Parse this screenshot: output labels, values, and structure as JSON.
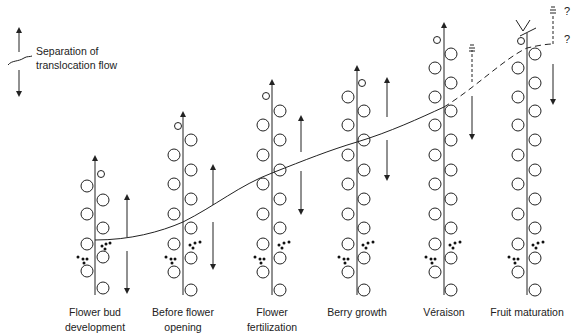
{
  "legend": {
    "line1": "Separation of",
    "line2": "translocation flow"
  },
  "stages": [
    {
      "line1": "Flower bud",
      "line2": "development",
      "x": 95
    },
    {
      "line1": "Before flower",
      "line2": "opening",
      "x": 183
    },
    {
      "line1": "Flower",
      "line2": "fertilization",
      "x": 272
    },
    {
      "line1": "Berry growth",
      "line2": "",
      "x": 357
    },
    {
      "line1": "Véraison",
      "line2": "",
      "x": 444
    },
    {
      "line1": "Fruit maturation",
      "line2": "",
      "x": 527
    }
  ],
  "annotations": {
    "q1": "?",
    "q2": "?"
  },
  "colors": {
    "line": "#222222",
    "background": "#ffffff"
  }
}
